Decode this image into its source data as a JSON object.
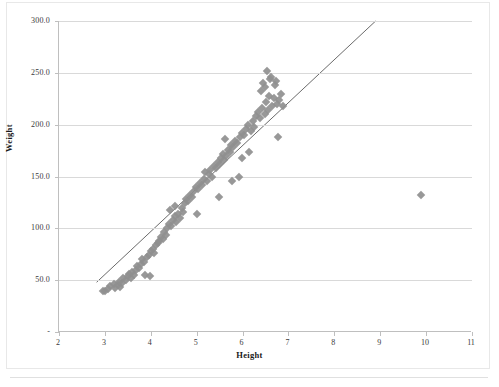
{
  "figure": {
    "kind": "scatter-plot",
    "marker_color": "#8f8f8f",
    "trendline_color": "#595959",
    "gridline_color": "#d9d9d9",
    "axis_color": "#bfbfbf"
  },
  "chart_data": {
    "type": "scatter",
    "title": "",
    "xlabel": "Height",
    "ylabel": "Weight",
    "xlim": [
      2,
      11
    ],
    "ylim": [
      0,
      300
    ],
    "xticks": [
      "2",
      "3",
      "4",
      "5",
      "6",
      "7",
      "8",
      "9",
      "10",
      "11"
    ],
    "xtick_values": [
      2,
      3,
      4,
      5,
      6,
      7,
      8,
      9,
      10,
      11
    ],
    "yticks": [
      "-",
      "50.0",
      "100.0",
      "150.0",
      "200.0",
      "250.0",
      "300.0"
    ],
    "ytick_values": [
      0,
      50,
      100,
      150,
      200,
      250,
      300
    ],
    "grid": "horizontal",
    "legend": "none",
    "trendline": {
      "label": "linear-fit",
      "x_start": 2.82,
      "y_start": 48,
      "x_end": 8.9,
      "y_end": 300
    },
    "series": [
      {
        "name": "Height vs Weight",
        "marker": "diamond",
        "points": [
          [
            2.97,
            40
          ],
          [
            3.02,
            40
          ],
          [
            3.08,
            41
          ],
          [
            3.14,
            44
          ],
          [
            3.22,
            46
          ],
          [
            3.25,
            42
          ],
          [
            3.3,
            45
          ],
          [
            3.32,
            48
          ],
          [
            3.35,
            43
          ],
          [
            3.4,
            47
          ],
          [
            3.42,
            52
          ],
          [
            3.48,
            50
          ],
          [
            3.52,
            54
          ],
          [
            3.55,
            56
          ],
          [
            3.58,
            52
          ],
          [
            3.62,
            58
          ],
          [
            3.65,
            55
          ],
          [
            3.7,
            60
          ],
          [
            3.72,
            64
          ],
          [
            3.76,
            62
          ],
          [
            3.8,
            66
          ],
          [
            3.84,
            70
          ],
          [
            3.88,
            68
          ],
          [
            3.9,
            55
          ],
          [
            3.94,
            72
          ],
          [
            3.98,
            74
          ],
          [
            4.0,
            54
          ],
          [
            4.02,
            78
          ],
          [
            4.06,
            80
          ],
          [
            4.1,
            76
          ],
          [
            4.14,
            84
          ],
          [
            4.18,
            86
          ],
          [
            4.2,
            88
          ],
          [
            4.24,
            92
          ],
          [
            4.28,
            90
          ],
          [
            4.32,
            96
          ],
          [
            4.36,
            94
          ],
          [
            4.38,
            100
          ],
          [
            4.42,
            104
          ],
          [
            4.44,
            118
          ],
          [
            4.46,
            102
          ],
          [
            4.5,
            108
          ],
          [
            4.54,
            112
          ],
          [
            4.56,
            122
          ],
          [
            4.58,
            106
          ],
          [
            4.62,
            114
          ],
          [
            4.66,
            110
          ],
          [
            4.7,
            120
          ],
          [
            4.72,
            116
          ],
          [
            4.76,
            124
          ],
          [
            4.8,
            128
          ],
          [
            4.84,
            126
          ],
          [
            4.88,
            132
          ],
          [
            4.92,
            130
          ],
          [
            4.96,
            136
          ],
          [
            5.0,
            140
          ],
          [
            5.02,
            114
          ],
          [
            5.06,
            138
          ],
          [
            5.1,
            144
          ],
          [
            5.14,
            142
          ],
          [
            5.18,
            148
          ],
          [
            5.2,
            154
          ],
          [
            5.24,
            146
          ],
          [
            5.28,
            152
          ],
          [
            5.32,
            156
          ],
          [
            5.36,
            150
          ],
          [
            5.4,
            160
          ],
          [
            5.44,
            158
          ],
          [
            5.48,
            164
          ],
          [
            5.5,
            130
          ],
          [
            5.52,
            162
          ],
          [
            5.56,
            168
          ],
          [
            5.6,
            172
          ],
          [
            5.62,
            166
          ],
          [
            5.64,
            186
          ],
          [
            5.66,
            170
          ],
          [
            5.7,
            176
          ],
          [
            5.74,
            174
          ],
          [
            5.78,
            180
          ],
          [
            5.8,
            146
          ],
          [
            5.82,
            178
          ],
          [
            5.86,
            184
          ],
          [
            5.9,
            182
          ],
          [
            5.94,
            150
          ],
          [
            5.96,
            188
          ],
          [
            6.0,
            192
          ],
          [
            6.02,
            168
          ],
          [
            6.06,
            190
          ],
          [
            6.1,
            196
          ],
          [
            6.14,
            200
          ],
          [
            6.16,
            174
          ],
          [
            6.2,
            194
          ],
          [
            6.24,
            204
          ],
          [
            6.28,
            198
          ],
          [
            6.32,
            208
          ],
          [
            6.36,
            212
          ],
          [
            6.4,
            206
          ],
          [
            6.42,
            232
          ],
          [
            6.44,
            216
          ],
          [
            6.46,
            240
          ],
          [
            6.5,
            210
          ],
          [
            6.52,
            236
          ],
          [
            6.54,
            222
          ],
          [
            6.56,
            252
          ],
          [
            6.58,
            214
          ],
          [
            6.6,
            228
          ],
          [
            6.62,
            244
          ],
          [
            6.64,
            246
          ],
          [
            6.66,
            218
          ],
          [
            6.7,
            226
          ],
          [
            6.72,
            238
          ],
          [
            6.74,
            242
          ],
          [
            6.78,
            220
          ],
          [
            6.8,
            188
          ],
          [
            6.82,
            224
          ],
          [
            6.86,
            230
          ],
          [
            6.9,
            218
          ],
          [
            9.92,
            132
          ]
        ]
      }
    ]
  }
}
